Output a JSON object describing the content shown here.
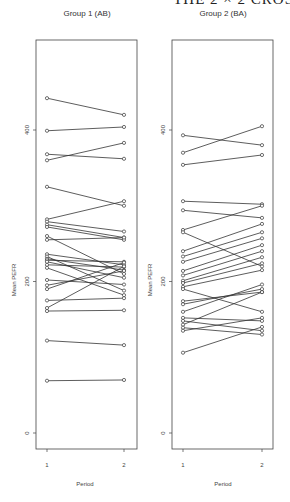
{
  "page_header": "THE 2 × 2 CROS",
  "chart_data": [
    {
      "type": "line",
      "title": "Group 1 (AB)",
      "xlabel": "Period",
      "ylabel": "Mean PEFR",
      "x": [
        1,
        2
      ],
      "xticks": [
        "1",
        "2"
      ],
      "yticks": [
        0,
        200,
        400
      ],
      "ylim": [
        -20,
        540
      ],
      "grid": false,
      "series": [
        {
          "name": "s1",
          "values": [
            442,
            420
          ]
        },
        {
          "name": "s2",
          "values": [
            399,
            404
          ]
        },
        {
          "name": "s3",
          "values": [
            368,
            362
          ]
        },
        {
          "name": "s4",
          "values": [
            360,
            383
          ]
        },
        {
          "name": "s5",
          "values": [
            325,
            300
          ]
        },
        {
          "name": "s6",
          "values": [
            282,
            306
          ]
        },
        {
          "name": "s7",
          "values": [
            279,
            266
          ]
        },
        {
          "name": "s8",
          "values": [
            275,
            258
          ]
        },
        {
          "name": "s9",
          "values": [
            272,
            255
          ]
        },
        {
          "name": "s10",
          "values": [
            260,
            210
          ]
        },
        {
          "name": "s11",
          "values": [
            255,
            258
          ]
        },
        {
          "name": "s12",
          "values": [
            236,
            222
          ]
        },
        {
          "name": "s13",
          "values": [
            233,
            188
          ]
        },
        {
          "name": "s14",
          "values": [
            230,
            215
          ]
        },
        {
          "name": "s15",
          "values": [
            228,
            226
          ]
        },
        {
          "name": "s16",
          "values": [
            226,
            205
          ]
        },
        {
          "name": "s17",
          "values": [
            222,
            219
          ]
        },
        {
          "name": "s18",
          "values": [
            218,
            182
          ]
        },
        {
          "name": "s19",
          "values": [
            202,
            196
          ]
        },
        {
          "name": "s20",
          "values": [
            195,
            214
          ]
        },
        {
          "name": "s21",
          "values": [
            190,
            225
          ]
        },
        {
          "name": "s22",
          "values": [
            175,
            178
          ]
        },
        {
          "name": "s23",
          "values": [
            165,
            220
          ]
        },
        {
          "name": "s24",
          "values": [
            161,
            162
          ]
        },
        {
          "name": "s25",
          "values": [
            122,
            116
          ]
        },
        {
          "name": "s26",
          "values": [
            69,
            70
          ]
        }
      ]
    },
    {
      "type": "line",
      "title": "Group 2 (BA)",
      "xlabel": "Period",
      "ylabel": "Mean PEFR",
      "x": [
        1,
        2
      ],
      "xticks": [
        "1",
        "2"
      ],
      "yticks": [
        0,
        200,
        400
      ],
      "ylim": [
        -20,
        540
      ],
      "grid": false,
      "series": [
        {
          "name": "s1",
          "values": [
            393,
            380
          ]
        },
        {
          "name": "s2",
          "values": [
            370,
            405
          ]
        },
        {
          "name": "s3",
          "values": [
            354,
            367
          ]
        },
        {
          "name": "s4",
          "values": [
            306,
            302
          ]
        },
        {
          "name": "s5",
          "values": [
            294,
            284
          ]
        },
        {
          "name": "s6",
          "values": [
            268,
            300
          ]
        },
        {
          "name": "s7",
          "values": [
            265,
            220
          ]
        },
        {
          "name": "s8",
          "values": [
            240,
            276
          ]
        },
        {
          "name": "s9",
          "values": [
            233,
            265
          ]
        },
        {
          "name": "s10",
          "values": [
            226,
            257
          ]
        },
        {
          "name": "s11",
          "values": [
            214,
            248
          ]
        },
        {
          "name": "s12",
          "values": [
            208,
            240
          ]
        },
        {
          "name": "s13",
          "values": [
            201,
            232
          ]
        },
        {
          "name": "s14",
          "values": [
            198,
            224
          ]
        },
        {
          "name": "s15",
          "values": [
            193,
            215
          ]
        },
        {
          "name": "s16",
          "values": [
            190,
            160
          ]
        },
        {
          "name": "s17",
          "values": [
            174,
            186
          ]
        },
        {
          "name": "s18",
          "values": [
            170,
            190
          ]
        },
        {
          "name": "s19",
          "values": [
            160,
            196
          ]
        },
        {
          "name": "s20",
          "values": [
            152,
            148
          ]
        },
        {
          "name": "s21",
          "values": [
            148,
            135
          ]
        },
        {
          "name": "s22",
          "values": [
            143,
            186
          ]
        },
        {
          "name": "s23",
          "values": [
            139,
            130
          ]
        },
        {
          "name": "s24",
          "values": [
            135,
            152
          ]
        },
        {
          "name": "s25",
          "values": [
            106,
            140
          ]
        }
      ]
    }
  ]
}
